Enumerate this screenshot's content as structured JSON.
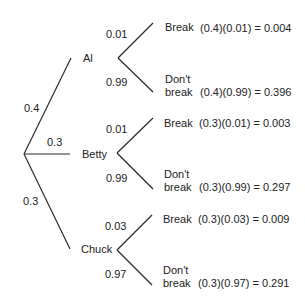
{
  "tree": {
    "root": {
      "branches": [
        {
          "prob": "0.4",
          "name": "Al"
        },
        {
          "prob": "0.3",
          "name": "Betty"
        },
        {
          "prob": "0.3",
          "name": "Chuck"
        }
      ]
    },
    "people": [
      {
        "name": "Al",
        "break_prob": "0.01",
        "nobreak_prob": "0.99",
        "break_label": "Break",
        "nobreak_label_1": "Don't",
        "nobreak_label_2": "break",
        "break_calc": "(0.4)(0.01) = 0.004",
        "nobreak_calc": "(0.4)(0.99) = 0.396"
      },
      {
        "name": "Betty",
        "break_prob": "0.01",
        "nobreak_prob": "0.99",
        "break_label": "Break",
        "nobreak_label_1": "Don't",
        "nobreak_label_2": "break",
        "break_calc": "(0.3)(0.01) = 0.003",
        "nobreak_calc": "(0.3)(0.99) = 0.297"
      },
      {
        "name": "Chuck",
        "break_prob": "0.03",
        "nobreak_prob": "0.97",
        "break_label": "Break",
        "nobreak_label_1": "Don't",
        "nobreak_label_2": "break",
        "break_calc": "(0.3)(0.03) = 0.009",
        "nobreak_calc": "(0.3)(0.97) = 0.291"
      }
    ]
  }
}
